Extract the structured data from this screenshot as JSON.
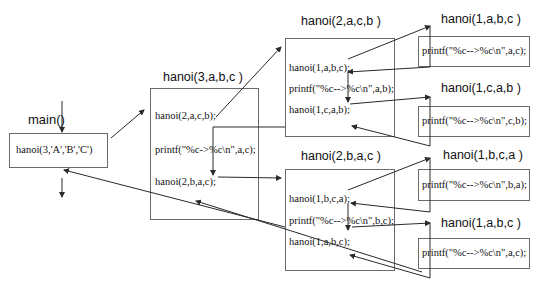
{
  "diagram": {
    "main": {
      "label": "main()",
      "call": "hanoi(3,'A','B','C')"
    },
    "level3": {
      "title": "hanoi(3,a,b,c )",
      "lines": [
        "hanoi(2,a,c,b);",
        "printf(\"%c->%c\\n\",a,c);",
        "hanoi(2,b,a,c);"
      ]
    },
    "level2_top": {
      "title": "hanoi(2,a,c,b )",
      "lines": [
        "hanoi(1,a,b,c);",
        "printf(\"%c-->%c\\n\",a,b);",
        "hanoi(1,c,a,b);"
      ]
    },
    "level2_bottom": {
      "title": "hanoi(2,b,a,c )",
      "lines": [
        "hanoi(1,b,c,a);",
        "printf(\"%c-->%c\\n\",b,c);",
        "hanoi(1,a,b,c);"
      ]
    },
    "leaves": [
      {
        "title": "hanoi(1,a,b,c )",
        "line": "printf(\"%c-->%c\\n\",a,c);"
      },
      {
        "title": "hanoi(1,c,a,b )",
        "line": "printf(\"%c-->%c\\n\",c,b);"
      },
      {
        "title": "hanoi(1,b,c,a )",
        "line": "printf(\"%c-->%c\\n\",b,a);"
      },
      {
        "title": "hanoi(1,a,b,c )",
        "line": "printf(\"%c-->%c\\n\",a,c);"
      }
    ]
  },
  "colors": {
    "line": "#2a2a2a",
    "border": "#6a6a6a",
    "text": "#111111"
  }
}
